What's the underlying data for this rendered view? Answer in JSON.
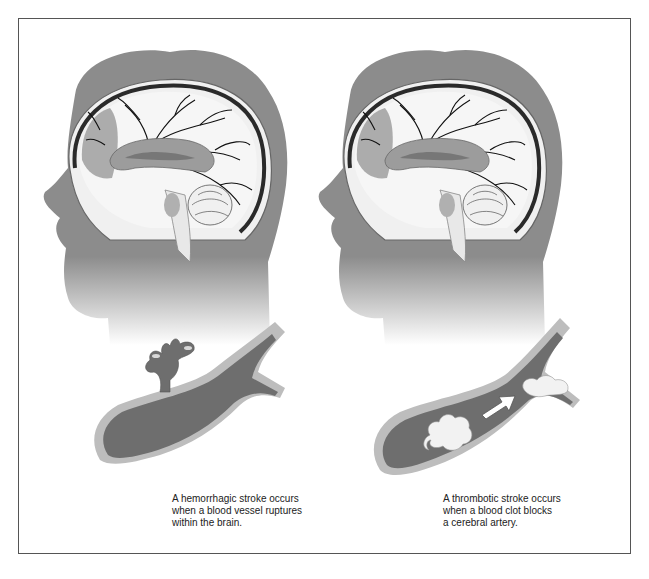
{
  "figure": {
    "panels": [
      {
        "id": "hemorrhagic",
        "type": "hemorrhagic-stroke",
        "caption_lines": [
          "A hemorrhagic stroke occurs",
          "when a blood vessel ruptures",
          "within the brain."
        ]
      },
      {
        "id": "thrombotic",
        "type": "thrombotic-stroke",
        "caption_lines": [
          "A thrombotic stroke occurs",
          "when a blood clot blocks",
          "a cerebral artery."
        ]
      }
    ],
    "colors": {
      "head": "#8c8c8c",
      "vessel_blood": "#6e6e6e",
      "vessel_wall": "#bdbdbd",
      "brain_white": "#f4f4f4",
      "brain_mid": "#a8a8a8",
      "brain_dark": "#7a7a7a",
      "frame": "#555555"
    }
  }
}
